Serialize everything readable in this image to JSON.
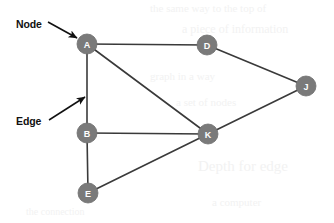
{
  "figure": {
    "background_color": "#ffffff",
    "width": 334,
    "height": 223
  },
  "style": {
    "node_fill": "#7a7a7a",
    "node_stroke": "#6e6e6e",
    "node_label_color": "#ffffff",
    "node_radius": 10,
    "edge_color": "#3a3a3a",
    "edge_width": 1.6,
    "annotation_color": "#111111",
    "ghost_color": "#f2f2f2"
  },
  "chart_data": {
    "type": "diagram",
    "subtype": "node-link-graph",
    "directed": false,
    "nodes": [
      {
        "id": "A",
        "label": "A",
        "x": 87,
        "y": 44
      },
      {
        "id": "D",
        "label": "D",
        "x": 207,
        "y": 45
      },
      {
        "id": "J",
        "label": "J",
        "x": 306,
        "y": 86
      },
      {
        "id": "B",
        "label": "B",
        "x": 87,
        "y": 133
      },
      {
        "id": "K",
        "label": "K",
        "x": 208,
        "y": 134
      },
      {
        "id": "E",
        "label": "E",
        "x": 88,
        "y": 193
      }
    ],
    "edges": [
      {
        "source": "A",
        "target": "D"
      },
      {
        "source": "A",
        "target": "B"
      },
      {
        "source": "A",
        "target": "K"
      },
      {
        "source": "D",
        "target": "J"
      },
      {
        "source": "B",
        "target": "K"
      },
      {
        "source": "B",
        "target": "E"
      },
      {
        "source": "E",
        "target": "K"
      },
      {
        "source": "K",
        "target": "J"
      }
    ],
    "node_count": 6,
    "edge_count": 8,
    "annotations": [
      {
        "id": "node-annotation",
        "text": "Node",
        "text_x": 16,
        "text_y": 24,
        "arrow_from_x": 48,
        "arrow_from_y": 22,
        "arrow_to_x": 77,
        "arrow_to_y": 38,
        "points_to": "A"
      },
      {
        "id": "edge-annotation",
        "text": "Edge",
        "text_x": 16,
        "text_y": 121,
        "arrow_from_x": 49,
        "arrow_from_y": 120,
        "arrow_to_x": 85,
        "arrow_to_y": 97,
        "points_to": "A-B"
      }
    ]
  },
  "ghost_artifacts": [
    {
      "text": "the same way to the top of",
      "x": 150,
      "y": 2,
      "size": 11
    },
    {
      "text": "a piece of information",
      "x": 182,
      "y": 22,
      "size": 12
    },
    {
      "text": "graph in a way",
      "x": 150,
      "y": 70,
      "size": 11
    },
    {
      "text": "a set of nodes",
      "x": 176,
      "y": 96,
      "size": 11
    },
    {
      "text": "Depth for edge",
      "x": 198,
      "y": 158,
      "size": 15
    },
    {
      "text": "a computer",
      "x": 212,
      "y": 196,
      "size": 11
    },
    {
      "text": "the connection",
      "x": 26,
      "y": 206,
      "size": 10
    }
  ]
}
